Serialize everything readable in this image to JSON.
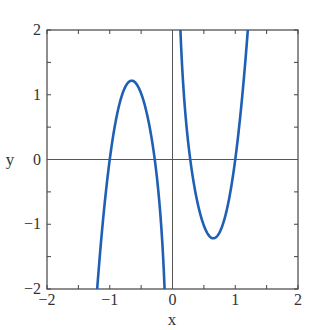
{
  "chart_data": {
    "type": "line",
    "title": "",
    "xlabel": "x",
    "ylabel": "y",
    "xlim": [
      -2,
      2
    ],
    "ylim": [
      -2,
      2
    ],
    "xticks": [
      "−2",
      "−1",
      "0",
      "1",
      "2"
    ],
    "yticks": [
      "−2",
      "−1",
      "0",
      "1",
      "2"
    ],
    "grid": false,
    "legend": null,
    "series": [
      {
        "name": "f(x)",
        "color": "#1f5fb4",
        "x": [
          -1.18,
          -1.0,
          -0.8,
          -0.6,
          -0.4,
          -0.27,
          -0.15,
          -0.06,
          0.06,
          0.15,
          0.3,
          0.5,
          0.65,
          0.8,
          1.0,
          1.2
        ],
        "y": [
          -2.0,
          0.0,
          0.89,
          1.17,
          0.72,
          0.0,
          -1.0,
          -2.0,
          2.0,
          1.0,
          0.0,
          -0.98,
          -1.13,
          -0.8,
          0.0,
          2.0
        ]
      }
    ],
    "annotations": [
      "vertical asymptote at x = 0",
      "horizontal reference line y = 0",
      "vertical reference line x = 0"
    ]
  }
}
